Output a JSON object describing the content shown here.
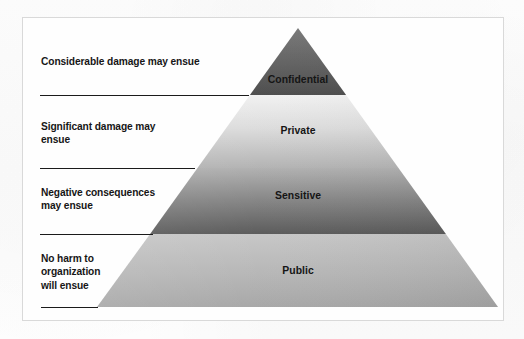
{
  "diagram": {
    "shape": "pyramid",
    "frame_color": "#d9d9d9",
    "background_color": "#fdfdfd",
    "apex": {
      "x": 298,
      "y": 28
    },
    "base_left": {
      "x": 97,
      "y": 307
    },
    "base_right": {
      "x": 498,
      "y": 307
    },
    "tiers": [
      {
        "label": "Confidential",
        "level": 1,
        "top_y": 28,
        "bottom_y": 95,
        "fill_top": "#6f6f6f",
        "fill_bottom": "#4f4f4f"
      },
      {
        "label": "Private",
        "level": 2,
        "top_y": 95,
        "bottom_y": 168,
        "fill_top": "#ededed",
        "fill_bottom": "#b5b5b5"
      },
      {
        "label": "Sensitive",
        "level": 3,
        "top_y": 168,
        "bottom_y": 234,
        "fill_top": "#adadad",
        "fill_bottom": "#5d5d5d"
      },
      {
        "label": "Public",
        "level": 4,
        "top_y": 234,
        "bottom_y": 307,
        "fill_top": "#c3c3c3",
        "fill_bottom": "#a9a9a9"
      }
    ],
    "callouts": [
      {
        "text": "Considerable damage may ensue",
        "tier": "Confidential",
        "leader_line": true
      },
      {
        "text": "Significant damage may\nensue",
        "tier": "Private",
        "leader_line": true
      },
      {
        "text": "Negative consequences\nmay ensue",
        "tier": "Sensitive",
        "leader_line": true
      },
      {
        "text": "No harm to\norganization\nwill ensue",
        "tier": "Public",
        "leader_line": true
      }
    ],
    "leader_line_color": "#1b1b1b",
    "text_color": "#161616"
  }
}
